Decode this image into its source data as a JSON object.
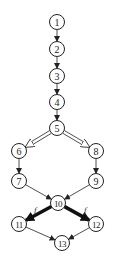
{
  "diagram": {
    "type": "directed-graph",
    "nodes": [
      {
        "id": "1",
        "label": "1",
        "x": 57,
        "y": 22
      },
      {
        "id": "2",
        "label": "2",
        "x": 57,
        "y": 49
      },
      {
        "id": "3",
        "label": "3",
        "x": 57,
        "y": 76
      },
      {
        "id": "4",
        "label": "4",
        "x": 57,
        "y": 102
      },
      {
        "id": "5",
        "label": "5",
        "x": 57,
        "y": 128
      },
      {
        "id": "6",
        "label": "6",
        "x": 19,
        "y": 151
      },
      {
        "id": "8",
        "label": "8",
        "x": 96,
        "y": 151
      },
      {
        "id": "7",
        "label": "7",
        "x": 19,
        "y": 181
      },
      {
        "id": "9",
        "label": "9",
        "x": 96,
        "y": 181
      },
      {
        "id": "10",
        "label": "10",
        "x": 58,
        "y": 203
      },
      {
        "id": "11",
        "label": "11",
        "x": 19,
        "y": 224
      },
      {
        "id": "12",
        "label": "12",
        "x": 96,
        "y": 224
      },
      {
        "id": "13",
        "label": "13",
        "x": 62,
        "y": 243
      }
    ],
    "edges": [
      {
        "from": "1",
        "to": "2",
        "style": "normal"
      },
      {
        "from": "2",
        "to": "3",
        "style": "normal"
      },
      {
        "from": "3",
        "to": "4",
        "style": "normal"
      },
      {
        "from": "4",
        "to": "5",
        "style": "normal"
      },
      {
        "from": "5",
        "to": "6",
        "style": "double"
      },
      {
        "from": "5",
        "to": "8",
        "style": "double"
      },
      {
        "from": "6",
        "to": "7",
        "style": "normal"
      },
      {
        "from": "8",
        "to": "9",
        "style": "normal"
      },
      {
        "from": "7",
        "to": "10",
        "style": "normal"
      },
      {
        "from": "9",
        "to": "10",
        "style": "normal"
      },
      {
        "from": "10",
        "to": "11",
        "style": "bold",
        "label": "f"
      },
      {
        "from": "10",
        "to": "12",
        "style": "bold",
        "label": "f"
      },
      {
        "from": "11",
        "to": "13",
        "style": "normal"
      },
      {
        "from": "12",
        "to": "13",
        "style": "normal"
      }
    ],
    "edge_labels": {
      "left": "f",
      "right": "f"
    }
  }
}
